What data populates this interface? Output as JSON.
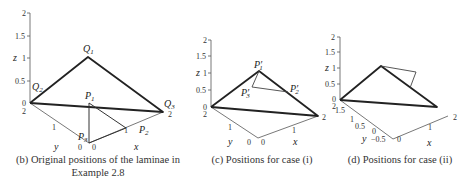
{
  "panels": [
    {
      "id": "b",
      "caption_line1": "(b) Original positions of the laminae in",
      "caption_line2": "Example 2.8",
      "z_ticks": [
        "2",
        "1.5",
        "1",
        "0.5",
        "0"
      ],
      "z_label": "z",
      "y_label": "y",
      "x_label": "x",
      "y_ticks": [
        "2",
        "1",
        "0"
      ],
      "x_ticks": [
        "0",
        "1",
        "2"
      ],
      "points": {
        "Q1": "Q",
        "Q1_sub": "1",
        "Q2": "Q",
        "Q2_sub": "2",
        "Q3": "Q",
        "Q3_sub": "3",
        "P1": "P",
        "P1_sub": "1",
        "P2": "P",
        "P2_sub": "2",
        "P3": "P",
        "P3_sub": "3"
      }
    },
    {
      "id": "c",
      "caption": "(c) Positions for case (i)",
      "z_ticks": [
        "2",
        "1.5",
        "1",
        "0.5",
        "0"
      ],
      "z_label": "z",
      "y_label": "y",
      "x_label": "x",
      "y_ticks": [
        "2",
        "1",
        "0"
      ],
      "x_ticks": [
        "0",
        "1",
        "2"
      ],
      "points": {
        "P1p": "P′",
        "P1p_sub": "1",
        "P2p": "P′",
        "P2p_sub": "2",
        "P3p": "P′",
        "P3p_sub": "3"
      }
    },
    {
      "id": "d",
      "caption": "(d) Positions for case (ii)",
      "z_ticks": [
        "2",
        "1.5",
        "1",
        "0.5",
        "0"
      ],
      "z_label": "z",
      "y_label": "y",
      "x_label": "x",
      "y_ticks": [
        "2",
        "1.5",
        "1",
        "0.5",
        "0",
        "−0.5"
      ],
      "x_ticks": [
        "0",
        "1",
        "2"
      ]
    }
  ]
}
